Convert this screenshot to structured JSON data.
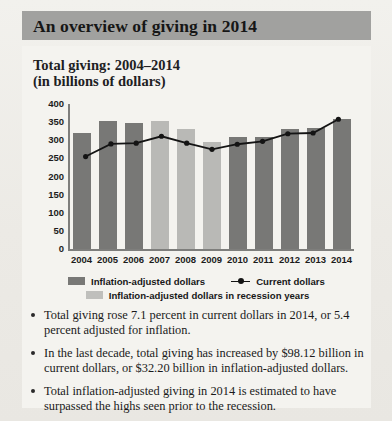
{
  "header": {
    "title": "An overview of giving in 2014"
  },
  "chart_panel": {
    "subtitle_line1": "Total giving: 2004–2014",
    "subtitle_line2": "(in billions of dollars)"
  },
  "chart_data": {
    "type": "bar",
    "title": "Total giving: 2004–2014 (in billions of dollars)",
    "xlabel": "",
    "ylabel": "",
    "ylim": [
      0,
      400
    ],
    "yticks": [
      400,
      350,
      300,
      250,
      200,
      150,
      100,
      50,
      0
    ],
    "grid": false,
    "legend_position": "bottom",
    "categories": [
      "2004",
      "2005",
      "2006",
      "2007",
      "2008",
      "2009",
      "2010",
      "2011",
      "2012",
      "2013",
      "2014"
    ],
    "recession_years": [
      "2007",
      "2008",
      "2009"
    ],
    "series": [
      {
        "name": "Inflation-adjusted dollars",
        "type": "bar",
        "color": "#787876",
        "values": [
          320,
          352,
          348,
          353,
          330,
          296,
          309,
          310,
          332,
          333,
          358
        ]
      },
      {
        "name": "Inflation-adjusted dollars in recession years",
        "type": "bar",
        "color": "#bfbfbc",
        "values": [
          null,
          null,
          null,
          353,
          330,
          296,
          null,
          null,
          null,
          null,
          null
        ]
      },
      {
        "name": "Current dollars",
        "type": "line",
        "color": "#141414",
        "values": [
          255,
          290,
          292,
          311,
          292,
          275,
          289,
          297,
          318,
          320,
          358
        ]
      }
    ],
    "legend": [
      {
        "label": "Inflation-adjusted dollars",
        "marker": "bar-dark"
      },
      {
        "label": "Current dollars",
        "marker": "line-dot"
      },
      {
        "label": "Inflation-adjusted dollars in recession years",
        "marker": "bar-light"
      }
    ]
  },
  "bullets": [
    "Total giving rose 7.1 percent in current dollars in 2014, or 5.4 percent adjusted for inflation.",
    "In the last decade, total giving has increased by $98.12 billion in current dollars, or $32.20 billion in inflation-adjusted dollars.",
    "Total inflation-adjusted giving in 2014 is estimated to have surpassed the highs seen prior to the recession."
  ],
  "colors": {
    "header_band": "#a1a19f",
    "panel_bg": "#f4f3ef",
    "bar_dark": "#787876",
    "bar_light": "#bfbfbc",
    "line": "#141414",
    "axis": "#7e7e7c"
  }
}
